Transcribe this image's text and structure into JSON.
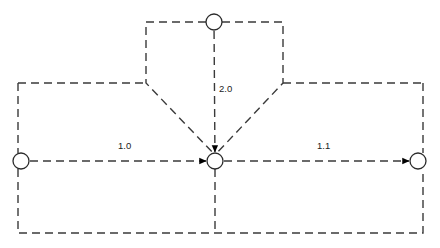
{
  "diagram": {
    "title": "",
    "type": "directed-graph",
    "background_color": "#ffffff",
    "stroke_color": "#3a3a3a",
    "node_stroke_color": "#2b2b2b",
    "arrow_color": "#000000",
    "label_color": "#1c1c1c",
    "line_style": "dashed",
    "dash_pattern": "8 5",
    "stroke_width": 1.4,
    "nodes": [
      {
        "id": "n_left",
        "name": "left-node",
        "label": "",
        "cx": 21,
        "cy": 161,
        "r": 8
      },
      {
        "id": "n_top",
        "name": "top-node",
        "label": "",
        "cx": 214,
        "cy": 22,
        "r": 8
      },
      {
        "id": "n_center",
        "name": "center-node",
        "label": "",
        "cx": 215,
        "cy": 161,
        "r": 8
      },
      {
        "id": "n_right",
        "name": "right-node",
        "label": "",
        "cx": 418,
        "cy": 161,
        "r": 8
      }
    ],
    "edges": [
      {
        "id": "e_left_center",
        "name": "edge-left-to-center",
        "from": "n_left",
        "to": "n_center",
        "label": "1.0",
        "label_x": 118,
        "label_y": 146,
        "arrowhead": true
      },
      {
        "id": "e_top_center",
        "name": "edge-top-to-center",
        "from": "n_top",
        "to": "n_center",
        "label": "2.0",
        "label_x": 219,
        "label_y": 89,
        "arrowhead": true
      },
      {
        "id": "e_center_right",
        "name": "edge-center-to-right",
        "from": "n_center",
        "to": "n_right",
        "label": "1.1",
        "label_x": 317,
        "label_y": 146,
        "arrowhead": true
      }
    ],
    "outer_loop": {
      "name": "outer-feedback-loop",
      "left_x": 18,
      "right_x": 423,
      "top_y": 83,
      "bottom_y": 233,
      "label": ""
    },
    "inner_funnel": {
      "name": "inner-funnel-loop",
      "left_x": 146,
      "right_x": 283,
      "top_y": 22,
      "shoulder_y": 83,
      "apex_x": 215,
      "apex_y": 155,
      "label": ""
    }
  }
}
